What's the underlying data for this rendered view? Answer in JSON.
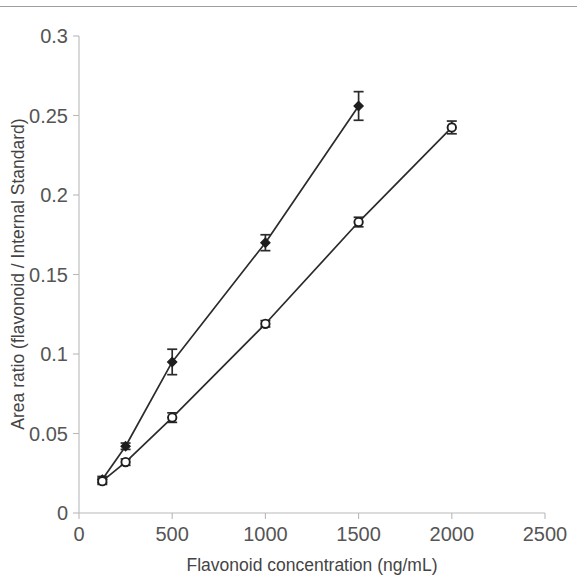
{
  "figure": {
    "background_color": "#ffffff",
    "has_top_rule": true,
    "ink_color": "#2b2b2b",
    "axis_color": "#b9b9b9"
  },
  "chart_data": {
    "type": "line",
    "title": "",
    "xlabel": "Flavonoid concentration (ng/mL)",
    "ylabel": "Area ratio (flavonoid / Internal Standard)",
    "xlim": [
      0,
      2500
    ],
    "ylim": [
      0,
      0.3
    ],
    "xticks": [
      0,
      500,
      1000,
      1500,
      2000,
      2500
    ],
    "xtick_labels": [
      "0",
      "500",
      "1000",
      "1500",
      "2000",
      "2500"
    ],
    "yticks": [
      0,
      0.05,
      0.1,
      0.15,
      0.2,
      0.25,
      0.3
    ],
    "ytick_labels": [
      "0",
      "0.05",
      "0.1",
      "0.15",
      "0.2",
      "0.25",
      "0.3"
    ],
    "grid": false,
    "legend": null,
    "legend_position": "none",
    "series": [
      {
        "name": "filled-diamond-series",
        "marker": "filled-diamond",
        "marker_style": "filled",
        "x": [
          125,
          250,
          500,
          1000,
          1500
        ],
        "values": [
          0.021,
          0.042,
          0.095,
          0.17,
          0.256
        ],
        "errors": [
          0.002,
          0.002,
          0.008,
          0.005,
          0.009
        ]
      },
      {
        "name": "open-circle-series",
        "marker": "open-circle",
        "marker_style": "open",
        "x": [
          125,
          250,
          500,
          1000,
          1500,
          2000
        ],
        "values": [
          0.02,
          0.032,
          0.06,
          0.119,
          0.183,
          0.2425
        ],
        "errors": [
          0.002,
          0.002,
          0.003,
          0.002,
          0.003,
          0.004
        ]
      }
    ]
  }
}
